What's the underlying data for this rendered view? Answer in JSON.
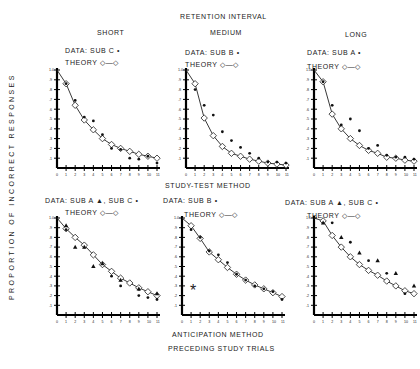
{
  "figure": {
    "header": "RETENTION  INTERVAL",
    "columns": [
      "SHORT",
      "MEDIUM",
      "LONG"
    ],
    "middle_label": "STUDY-TEST  METHOD",
    "bottom_label_1": "ANTICIPATION   METHOD",
    "bottom_label_2": "PRECEDING  STUDY  TRIALS",
    "y_axis_label": "PROPORTION   OF   INCORRECT   RESPONSES",
    "legends": {
      "top_short_data": "DATA: SUB C •",
      "top_medium_data": "DATA: SUB B •",
      "top_long_data": "DATA: SUB A •",
      "bottom_short_data": "DATA: SUB A ▲,  SUB C •",
      "bottom_medium_data": "DATA: SUB B •",
      "bottom_long_data": "DATA: SUB A ▲,  SUB C •",
      "theory": "THEORY ◇—◇"
    },
    "asterisk": "*"
  },
  "chart_data": [
    {
      "type": "scatter",
      "title": "Study-Test Method, Short retention interval",
      "xlabel": "Preceding study trials",
      "ylabel": "Proportion of incorrect responses",
      "x": [
        0,
        1,
        2,
        3,
        4,
        5,
        6,
        7,
        8,
        9,
        10,
        11
      ],
      "ylim": [
        0,
        1.0
      ],
      "yticks": [
        ".1",
        ".2",
        ".3",
        ".4",
        ".5",
        ".6",
        ".7",
        ".8",
        ".9",
        "1.0"
      ],
      "series": [
        {
          "name": "Theory",
          "values": [
            1.0,
            0.86,
            0.64,
            0.49,
            0.39,
            0.3,
            0.24,
            0.2,
            0.17,
            0.14,
            0.12,
            0.1
          ]
        },
        {
          "name": "Sub C",
          "values": [
            null,
            0.86,
            0.69,
            0.52,
            0.48,
            0.34,
            0.2,
            0.19,
            0.1,
            0.09,
            0.12,
            0.05
          ]
        }
      ]
    },
    {
      "type": "scatter",
      "title": "Study-Test Method, Medium retention interval",
      "xlabel": "Preceding study trials",
      "ylabel": "Proportion of incorrect responses",
      "x": [
        0,
        1,
        2,
        3,
        4,
        5,
        6,
        7,
        8,
        9,
        10,
        11
      ],
      "ylim": [
        0,
        1.0
      ],
      "yticks": [
        ".1",
        ".2",
        ".3",
        ".4",
        ".5",
        ".6",
        ".7",
        ".8",
        ".9",
        "1.0"
      ],
      "series": [
        {
          "name": "Theory",
          "values": [
            1.0,
            0.86,
            0.51,
            0.33,
            0.22,
            0.15,
            0.12,
            0.09,
            0.07,
            0.05,
            0.04,
            0.03
          ]
        },
        {
          "name": "Sub B",
          "values": [
            null,
            0.8,
            0.64,
            0.54,
            0.37,
            0.28,
            0.21,
            0.15,
            0.1,
            0.06,
            0.06,
            0.05
          ]
        }
      ]
    },
    {
      "type": "scatter",
      "title": "Study-Test Method, Long retention interval",
      "xlabel": "Preceding study trials",
      "ylabel": "Proportion of incorrect responses",
      "x": [
        0,
        1,
        2,
        3,
        4,
        5,
        6,
        7,
        8,
        9,
        10,
        11
      ],
      "ylim": [
        0,
        1.0
      ],
      "yticks": [
        ".1",
        ".2",
        ".3",
        ".4",
        ".5",
        ".6",
        ".7",
        ".8",
        ".9",
        "1.0"
      ],
      "series": [
        {
          "name": "Theory",
          "values": [
            1.0,
            0.88,
            0.55,
            0.4,
            0.3,
            0.23,
            0.18,
            0.15,
            0.11,
            0.1,
            0.08,
            0.07
          ]
        },
        {
          "name": "Sub A",
          "values": [
            null,
            0.88,
            0.64,
            0.44,
            0.5,
            0.38,
            0.2,
            0.23,
            0.13,
            0.11,
            0.11,
            0.09
          ]
        }
      ]
    },
    {
      "type": "scatter",
      "title": "Anticipation Method, Short retention interval",
      "xlabel": "Preceding study trials",
      "ylabel": "Proportion of incorrect responses",
      "x": [
        0,
        1,
        2,
        3,
        4,
        5,
        6,
        7,
        8,
        9,
        10,
        11
      ],
      "ylim": [
        0,
        1.0
      ],
      "yticks": [
        ".1",
        ".2",
        ".3",
        ".4",
        ".5",
        ".6",
        ".7",
        ".8",
        ".9",
        "1.0"
      ],
      "series": [
        {
          "name": "Theory",
          "values": [
            1.0,
            0.89,
            0.8,
            0.72,
            0.62,
            0.52,
            0.45,
            0.38,
            0.33,
            0.28,
            0.24,
            0.2
          ]
        },
        {
          "name": "Sub A",
          "values": [
            null,
            0.92,
            0.7,
            0.7,
            0.5,
            0.53,
            null,
            0.36,
            null,
            0.27,
            null,
            0.22
          ]
        },
        {
          "name": "Sub C",
          "values": [
            null,
            0.88,
            null,
            null,
            null,
            null,
            0.4,
            0.3,
            null,
            0.2,
            0.18,
            0.16
          ]
        }
      ]
    },
    {
      "type": "scatter",
      "title": "Anticipation Method, Medium retention interval",
      "xlabel": "Preceding study trials",
      "ylabel": "Proportion of incorrect responses",
      "x": [
        0,
        1,
        2,
        3,
        4,
        5,
        6,
        7,
        8,
        9,
        10,
        11
      ],
      "ylim": [
        0,
        1.0
      ],
      "yticks": [
        ".1",
        ".2",
        ".3",
        ".4",
        ".5",
        ".6",
        ".7",
        ".8",
        ".9",
        "1.0"
      ],
      "series": [
        {
          "name": "Theory",
          "values": [
            1.0,
            0.92,
            0.79,
            0.65,
            0.57,
            0.49,
            0.42,
            0.36,
            0.31,
            0.27,
            0.23,
            0.19
          ]
        },
        {
          "name": "Sub B",
          "values": [
            null,
            0.88,
            0.8,
            0.66,
            0.62,
            0.54,
            0.42,
            0.36,
            0.3,
            0.27,
            0.24,
            0.16
          ]
        }
      ]
    },
    {
      "type": "scatter",
      "title": "Anticipation Method, Long retention interval",
      "xlabel": "Preceding study trials",
      "ylabel": "Proportion of incorrect responses",
      "x": [
        0,
        1,
        2,
        3,
        4,
        5,
        6,
        7,
        8,
        9,
        10,
        11
      ],
      "ylim": [
        0,
        1.0
      ],
      "yticks": [
        ".1",
        ".2",
        ".3",
        ".4",
        ".5",
        ".6",
        ".7",
        ".8",
        ".9",
        "1.0"
      ],
      "series": [
        {
          "name": "Theory",
          "values": [
            1.0,
            0.97,
            0.82,
            0.7,
            0.6,
            0.52,
            0.46,
            0.41,
            0.35,
            0.3,
            0.25,
            0.22
          ]
        },
        {
          "name": "Sub A",
          "values": [
            null,
            0.95,
            null,
            0.8,
            null,
            0.64,
            null,
            0.56,
            null,
            0.43,
            null,
            0.3
          ]
        },
        {
          "name": "Sub C",
          "values": [
            null,
            null,
            0.95,
            null,
            0.75,
            null,
            0.56,
            null,
            0.43,
            null,
            0.22,
            null
          ]
        }
      ]
    }
  ]
}
